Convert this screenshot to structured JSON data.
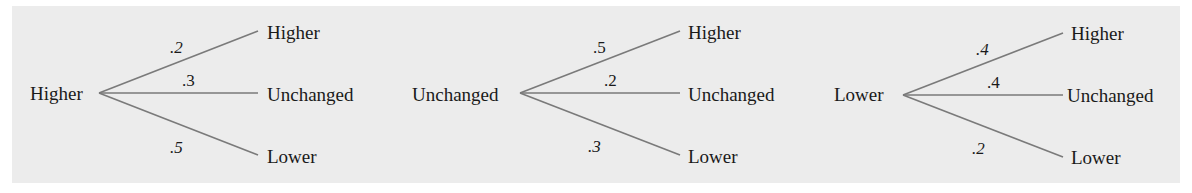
{
  "diagram": {
    "type": "probability-tree",
    "background_color": "#ececec",
    "line_color": "#7a7a7a",
    "trees": [
      {
        "root": "Higher",
        "branches": [
          {
            "to": "Higher",
            "prob": ".2"
          },
          {
            "to": "Unchanged",
            "prob": ".3"
          },
          {
            "to": "Lower",
            "prob": ".5"
          }
        ]
      },
      {
        "root": "Unchanged",
        "branches": [
          {
            "to": "Higher",
            "prob": ".5"
          },
          {
            "to": "Unchanged",
            "prob": ".2"
          },
          {
            "to": "Lower",
            "prob": ".3"
          }
        ]
      },
      {
        "root": "Lower",
        "branches": [
          {
            "to": "Higher",
            "prob": ".4"
          },
          {
            "to": "Unchanged",
            "prob": ".4"
          },
          {
            "to": "Lower",
            "prob": ".2"
          }
        ]
      }
    ]
  }
}
